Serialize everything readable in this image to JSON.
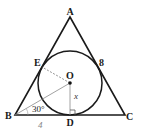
{
  "diagram": {
    "type": "geometry",
    "colors": {
      "stroke": "#1a1a1a",
      "thin_line": "#7a7a7a",
      "background": "#ffffff"
    },
    "points": {
      "A": {
        "label": "A",
        "x": 70,
        "y": 17
      },
      "B": {
        "label": "B",
        "x": 15,
        "y": 115
      },
      "C": {
        "label": "C",
        "x": 125,
        "y": 115
      },
      "D": {
        "label": "D",
        "x": 70,
        "y": 115
      },
      "E": {
        "label": "E",
        "x": 42,
        "y": 65
      },
      "F": {
        "label": "8",
        "x": 98,
        "y": 65
      },
      "O": {
        "label": "O",
        "x": 70,
        "y": 83
      }
    },
    "circle": {
      "cx": 70,
      "cy": 83,
      "r": 32
    },
    "annotations": {
      "angle_B": "30°",
      "segment_BD": "4",
      "segment_OD": "x"
    }
  }
}
